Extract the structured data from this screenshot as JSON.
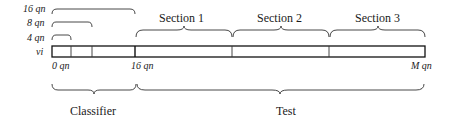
{
  "left_labels": {
    "l16": "16 qn",
    "l8": "8 qn",
    "l4": "4 qn",
    "vi": "vi"
  },
  "axis_labels": {
    "start": "0 qn",
    "mid": "16 qn",
    "end": "M qn"
  },
  "sections": [
    {
      "label": "Section 1"
    },
    {
      "label": "Section 2"
    },
    {
      "label": "Section 3"
    }
  ],
  "bottom_labels": {
    "classifier": "Classifier",
    "test": "Test"
  }
}
